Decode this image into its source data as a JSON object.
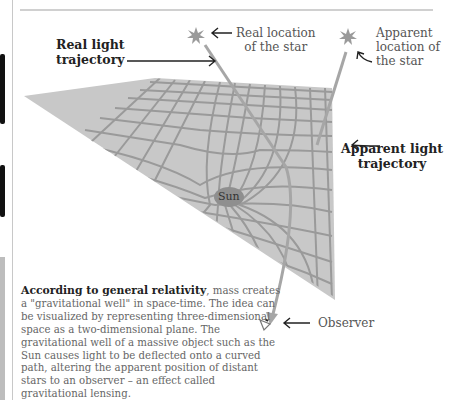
{
  "diagram": {
    "labels": {
      "real_light": [
        "Real light",
        "trajectory"
      ],
      "real_location": [
        "Real location",
        "of the star"
      ],
      "apparent_location": [
        "Apparent",
        "location of",
        "the star"
      ],
      "apparent_light": [
        "Apparent light",
        "trajectory"
      ],
      "sun": "Sun",
      "observer": "Observer"
    },
    "colors": {
      "plane": "#c8c8c8",
      "grid": "#9a9a9a",
      "sun": "#8f8f8f",
      "light_path": "#a6a6a6",
      "text_dark": "#222222",
      "text_gray": "#555555"
    }
  },
  "caption": {
    "lead": "According to general relativity",
    "lead_punct": ",",
    "body": "mass creates a \"gravitational well\" in space-time. The idea can be visualized by representing three-dimensional space as a two-dimensional plane. The gravitational well of a massive object such as the Sun causes light to be deflected onto a curved path, altering the apparent position of distant stars to an observer – an effect called gravitational lensing."
  }
}
